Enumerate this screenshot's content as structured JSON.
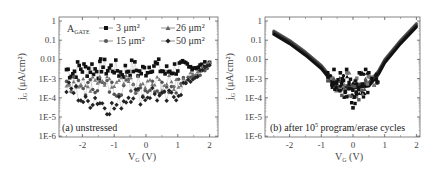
{
  "chart_data": [
    {
      "type": "scatter",
      "panel": "a",
      "title": "",
      "annotation": "(a) unstressed",
      "xlabel": "V_G (V)",
      "ylabel": "j_G (μA/cm²)",
      "yscale": "log",
      "xlim": [
        -2.6,
        2.1
      ],
      "ylim": [
        1e-06,
        1.5
      ],
      "x_ticks": [
        "-2",
        "-1",
        "0",
        "1",
        "2"
      ],
      "y_ticks": [
        "1",
        "0.1",
        "0.01",
        "1E-3",
        "1E-4",
        "1E-5",
        "1E-6"
      ],
      "legend_title": "A_GATE",
      "legend_position": "upper",
      "series": [
        {
          "name": "3 μm²",
          "marker": "square",
          "x": [
            -2.5,
            -2.3,
            -2.1,
            -1.9,
            -1.7,
            -1.5,
            -1.4,
            -1.2,
            -1.0,
            -0.8,
            -0.6,
            -0.4,
            -0.2,
            0.0,
            0.2,
            0.4,
            0.6,
            0.8,
            1.0,
            1.2,
            1.4,
            1.6,
            1.8,
            2.0
          ],
          "y": [
            0.003,
            0.002,
            0.004,
            0.003,
            0.004,
            0.002,
            0.005,
            0.003,
            0.004,
            0.002,
            0.003,
            0.004,
            0.002,
            0.003,
            0.006,
            0.004,
            0.002,
            0.003,
            0.004,
            0.003,
            0.004,
            0.004,
            0.005,
            0.007
          ]
        },
        {
          "name": "15 μm²",
          "marker": "circle",
          "x": [
            -2.5,
            -2.2,
            -1.9,
            -1.6,
            -1.3,
            -1.0,
            -0.7,
            -0.4,
            -0.1,
            0.2,
            0.5,
            0.8,
            1.1,
            1.4,
            1.7,
            2.0
          ],
          "y": [
            0.0006,
            0.0004,
            0.0003,
            0.0005,
            0.0004,
            0.0003,
            0.0004,
            0.0005,
            0.0003,
            0.0004,
            0.0005,
            0.0004,
            0.0006,
            0.001,
            0.002,
            0.006
          ]
        },
        {
          "name": "26 μm²",
          "marker": "triangle",
          "x": [
            -2.5,
            -2.2,
            -1.9,
            -1.6,
            -1.3,
            -1.0,
            -0.7,
            -0.4,
            -0.1,
            0.2,
            0.5,
            0.8,
            1.1,
            1.4,
            1.7,
            2.0
          ],
          "y": [
            0.0008,
            0.0005,
            0.0004,
            0.0006,
            0.0005,
            0.0004,
            0.0005,
            0.0006,
            0.0004,
            0.0005,
            0.0006,
            0.0005,
            0.0008,
            0.0015,
            0.003,
            0.007
          ]
        },
        {
          "name": "50 μm²",
          "marker": "diamond",
          "x": [
            -2.5,
            -2.2,
            -1.9,
            -1.6,
            -1.3,
            -1.0,
            -0.7,
            -0.4,
            -0.1,
            0.2,
            0.5,
            0.8,
            1.1,
            1.4,
            1.7,
            2.0
          ],
          "y": [
            0.0003,
            0.0002,
            5e-05,
            0.0001,
            4e-05,
            3e-05,
            8e-05,
            0.0002,
            0.0001,
            0.0002,
            8e-05,
            0.0001,
            0.0003,
            0.0008,
            0.002,
            0.005
          ]
        }
      ]
    },
    {
      "type": "scatter",
      "panel": "b",
      "title": "",
      "annotation": "(b) after 10⁵ program/erase cycles",
      "xlabel": "V_G (V)",
      "ylabel": "j_G (μA/cm²)",
      "yscale": "log",
      "xlim": [
        -2.6,
        2.1
      ],
      "ylim": [
        1e-06,
        1.5
      ],
      "x_ticks": [
        "-2",
        "-1",
        "0",
        "1",
        "2"
      ],
      "y_ticks": [
        "1",
        "0.1",
        "0.01",
        "1E-3",
        "1E-4",
        "1E-5",
        "1E-6"
      ],
      "series": [
        {
          "name": "envelope (all areas)",
          "marker": "line",
          "x": [
            -2.5,
            -2.0,
            -1.5,
            -1.0,
            -0.7,
            -0.5,
            0.5,
            0.8,
            1.0,
            1.5,
            2.0
          ],
          "y": [
            0.25,
            0.08,
            0.02,
            0.004,
            0.001,
            0.0003,
            0.0005,
            0.002,
            0.008,
            0.08,
            0.6
          ]
        },
        {
          "name": "scatter near 0 V",
          "marker": "square",
          "x": [
            -0.8,
            -0.6,
            -0.4,
            -0.3,
            -0.2,
            -0.1,
            0.0,
            0.1,
            0.2,
            0.3,
            0.4,
            0.5,
            0.6
          ],
          "y": [
            0.002,
            0.003,
            0.002,
            0.0008,
            0.003,
            0.0003,
            3e-05,
            0.0002,
            0.002,
            0.0005,
            0.003,
            0.002,
            0.001
          ]
        }
      ]
    }
  ],
  "panels": {
    "a": {
      "annotation": "(a) unstressed",
      "xlabel_main": "V",
      "xlabel_sub": "G",
      "xlabel_unit": " (V)",
      "ylabel_main": "j",
      "ylabel_sub": "G",
      "ylabel_unit": " (μA/cm²)",
      "legend": {
        "title_main": "A",
        "title_sub": "GATE",
        "items": [
          "3 μm²",
          "15 μm²",
          "26 μm²",
          "50 μm²"
        ]
      }
    },
    "b": {
      "annotation": "(b) after 10⁵ program/erase cycles",
      "xlabel_main": "V",
      "xlabel_sub": "G",
      "xlabel_unit": " (V)",
      "ylabel_main": "j",
      "ylabel_sub": "G",
      "ylabel_unit": " (μA/cm²)"
    }
  },
  "y_ticks": [
    "1",
    "0.1",
    "0.01",
    "1E-3",
    "1E-4",
    "1E-5",
    "1E-6"
  ],
  "x_ticks": [
    "-2",
    "-1",
    "0",
    "1",
    "2"
  ],
  "colors": {
    "frame": "#555555",
    "series_3": "#111111",
    "series_15": "#555555",
    "series_26": "#777777",
    "series_50": "#222222"
  }
}
